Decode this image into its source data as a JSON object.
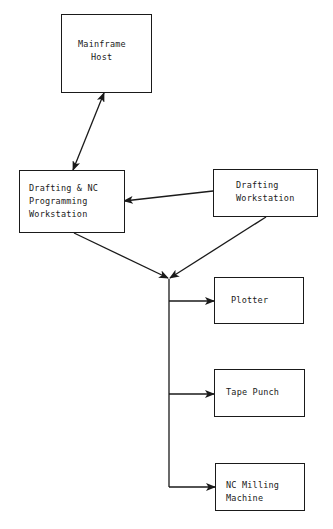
{
  "diagram": {
    "nodes": [
      {
        "id": "mainframe",
        "label_lines": [
          "Mainframe",
          "Host"
        ]
      },
      {
        "id": "drafting_nc",
        "label_lines": [
          "Drafting & NC",
          "Programming",
          "Workstation"
        ]
      },
      {
        "id": "drafting_ws",
        "label_lines": [
          "Drafting",
          "Workstation"
        ]
      },
      {
        "id": "plotter",
        "label_lines": [
          "Plotter"
        ]
      },
      {
        "id": "tape_punch",
        "label_lines": [
          "Tape Punch"
        ]
      },
      {
        "id": "nc_milling",
        "label_lines": [
          "NC Milling",
          "Machine"
        ]
      }
    ],
    "edges": [
      {
        "from": "mainframe",
        "to": "drafting_nc",
        "type": "bidirectional"
      },
      {
        "from": "drafting_ws",
        "to": "drafting_nc",
        "type": "directed"
      },
      {
        "from": "drafting_nc",
        "to": "junction",
        "type": "directed"
      },
      {
        "from": "drafting_ws",
        "to": "junction",
        "type": "directed"
      },
      {
        "from": "junction",
        "to": "plotter",
        "type": "directed"
      },
      {
        "from": "junction",
        "to": "tape_punch",
        "type": "directed"
      },
      {
        "from": "junction",
        "to": "nc_milling",
        "type": "directed"
      }
    ],
    "line_color": "#1a1a1a"
  }
}
